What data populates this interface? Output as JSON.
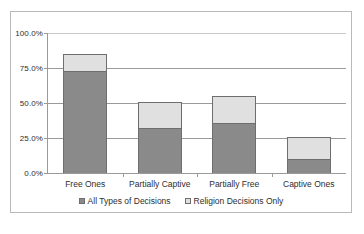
{
  "chart_data": {
    "type": "bar",
    "subtype": "stacked",
    "title": "",
    "subtitle": "",
    "xlabel": "",
    "ylabel": "",
    "categories": [
      "Free Ones",
      "Partially Captive",
      "Partially Free",
      "Captive Ones"
    ],
    "series": [
      {
        "name": "All Types of Decisions",
        "color": "#8a8a8a",
        "values": [
          73.0,
          32.0,
          36.0,
          10.0
        ]
      },
      {
        "name": "Religion Decisions Only",
        "color": "#e0e0e0",
        "values": [
          12.0,
          19.0,
          19.0,
          16.0
        ]
      }
    ],
    "stack_totals": [
      85.0,
      51.0,
      55.0,
      26.0
    ],
    "ylim": [
      0,
      100
    ],
    "ytick_values": [
      0,
      25,
      50,
      75,
      100
    ],
    "ytick_labels": [
      "0.0%",
      "25.0%",
      "50.0%",
      "75.0%",
      "100.0%"
    ],
    "grid": true,
    "grid_axis": "y",
    "legend_position": "bottom"
  },
  "legend": {
    "entries": [
      {
        "label": "All Types of Decisions",
        "swatch_color": "#8a8a8a"
      },
      {
        "label": "Religion Decisions Only",
        "swatch_color": "#e0e0e0"
      }
    ]
  },
  "colors": {
    "series_dark": "#8a8a8a",
    "series_light": "#e0e0e0",
    "bar_outline": "#6e6e6e",
    "axis": "#9a9a9a",
    "gridline": "#9a9a9a",
    "frame": "#b9b9b9",
    "text": "#2e2e2e",
    "background": "#ffffff"
  }
}
